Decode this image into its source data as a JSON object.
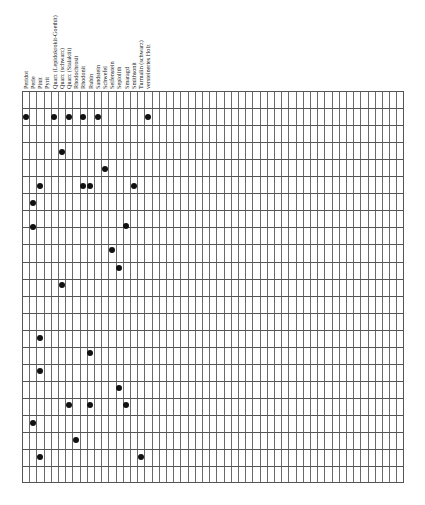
{
  "chart_data": {
    "type": "table",
    "title": "",
    "grid": {
      "left": 22,
      "top": 91,
      "width": 382,
      "height": 392,
      "columns": 53,
      "rows": 23,
      "col_width": 7.2,
      "row_height": 17.05
    },
    "columns": [
      "Peridot",
      "Perle",
      "Pinit",
      "Pyrit",
      "Quarz (Lepidokrokit-Goethit)",
      "Quarz (schwarz)",
      "Quarz (Stalaktit)",
      "Rhodochrosit",
      "Rhodonit",
      "Rubin",
      "Sandstein",
      "Schwefel",
      "Seifenstein",
      "Sepiolith",
      "Smaragd",
      "Smithsonit",
      "Turmalin (schwarz)",
      "versteinertes Holz"
    ],
    "points": [
      {
        "col": 0,
        "y": 117
      },
      {
        "col": 4,
        "y": 117
      },
      {
        "col": 6,
        "y": 117
      },
      {
        "col": 8,
        "y": 117
      },
      {
        "col": 10,
        "y": 117
      },
      {
        "col": 17,
        "y": 117
      },
      {
        "col": 5,
        "y": 152
      },
      {
        "col": 11,
        "y": 169
      },
      {
        "col": 2,
        "y": 186
      },
      {
        "col": 8,
        "y": 186
      },
      {
        "col": 9,
        "y": 186
      },
      {
        "col": 15,
        "y": 186
      },
      {
        "col": 1,
        "y": 203
      },
      {
        "col": 1,
        "y": 227
      },
      {
        "col": 14,
        "y": 226
      },
      {
        "col": 12,
        "y": 250
      },
      {
        "col": 13,
        "y": 268
      },
      {
        "col": 5,
        "y": 285
      },
      {
        "col": 2,
        "y": 338
      },
      {
        "col": 9,
        "y": 353
      },
      {
        "col": 2,
        "y": 371
      },
      {
        "col": 13,
        "y": 388
      },
      {
        "col": 6,
        "y": 405
      },
      {
        "col": 9,
        "y": 405
      },
      {
        "col": 14,
        "y": 405
      },
      {
        "col": 1,
        "y": 423
      },
      {
        "col": 7,
        "y": 440
      },
      {
        "col": 2,
        "y": 457
      },
      {
        "col": 16,
        "y": 457
      }
    ],
    "colors": {
      "grid": "#555555",
      "dot": "#111111",
      "background": "#ffffff"
    }
  }
}
